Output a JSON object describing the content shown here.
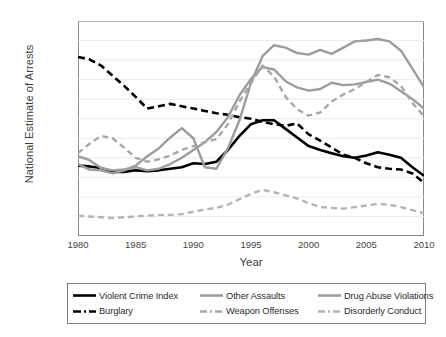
{
  "chart_data": {
    "type": "line",
    "title": "",
    "xlabel": "Year",
    "ylabel": "National Estimate of Arrests",
    "xlim": [
      1980,
      2010
    ],
    "ylim": [
      0,
      275000
    ],
    "ytick_step": 25000,
    "xtick_step": 1,
    "xtick_label_step": 5,
    "grid": "horizontal",
    "legend_position": "below",
    "ytick_labels": [
      "275,000",
      "250,000",
      "225,000",
      "200,000",
      "175,000",
      "150,000",
      "125,000",
      "100,000",
      "75,000",
      "50,000",
      "25,000",
      "0"
    ],
    "ytick_values": [
      275000,
      250000,
      225000,
      200000,
      175000,
      150000,
      125000,
      100000,
      75000,
      50000,
      25000,
      0
    ],
    "xtick_labels": [
      "1980",
      "1985",
      "1990",
      "1995",
      "2000",
      "2005",
      "2010"
    ],
    "xtick_values": [
      1980,
      1985,
      1990,
      1995,
      2000,
      2005,
      2010
    ],
    "x": [
      1980,
      1981,
      1982,
      1983,
      1984,
      1985,
      1986,
      1987,
      1988,
      1989,
      1990,
      1991,
      1992,
      1993,
      1994,
      1995,
      1996,
      1997,
      1998,
      1999,
      2000,
      2001,
      2002,
      2003,
      2004,
      2005,
      2006,
      2007,
      2008,
      2009,
      2010
    ],
    "series": [
      {
        "name": "Violent Crime Index",
        "color": "#000000",
        "style": "solid",
        "width": 2.6,
        "values": [
          90000,
          89000,
          87000,
          82000,
          82000,
          84000,
          83000,
          84000,
          86000,
          88000,
          93000,
          92000,
          95000,
          110000,
          128000,
          143000,
          148000,
          148000,
          137000,
          126000,
          115000,
          110000,
          106000,
          102000,
          100000,
          103000,
          107000,
          104000,
          100000,
          88000,
          77000
        ]
      },
      {
        "name": "Burglary",
        "color": "#000000",
        "style": "dashed",
        "width": 2.6,
        "values": [
          229000,
          226000,
          218000,
          205000,
          192000,
          178000,
          163000,
          166000,
          169000,
          166000,
          163000,
          160000,
          157000,
          155000,
          152000,
          150000,
          146000,
          143000,
          141000,
          144000,
          130000,
          122000,
          113000,
          104000,
          100000,
          93000,
          88000,
          86000,
          85000,
          80000,
          68000
        ]
      },
      {
        "name": "Other Assaults",
        "color": "#9d9d9d",
        "style": "solid",
        "width": 2.4,
        "values": [
          102000,
          97000,
          87000,
          84000,
          85000,
          88000,
          84000,
          86000,
          92000,
          100000,
          110000,
          120000,
          133000,
          152000,
          180000,
          201000,
          216000,
          213000,
          198000,
          190000,
          186000,
          188000,
          196000,
          193000,
          194000,
          197000,
          200000,
          195000,
          185000,
          175000,
          163000
        ]
      },
      {
        "name": "Weapon Offenses",
        "color": "#a8a8a8",
        "style": "dashed",
        "width": 2.4,
        "values": [
          106000,
          118000,
          128000,
          125000,
          113000,
          100000,
          95000,
          98000,
          103000,
          110000,
          115000,
          120000,
          124000,
          143000,
          172000,
          196000,
          218000,
          204000,
          178000,
          162000,
          154000,
          158000,
          172000,
          181000,
          188000,
          197000,
          206000,
          203000,
          192000,
          170000,
          153000
        ]
      },
      {
        "name": "Drug Abuse Violations",
        "color": "#9d9d9d",
        "style": "solid",
        "width": 2.4,
        "values": [
          92000,
          85000,
          84000,
          80000,
          84000,
          90000,
          102000,
          112000,
          126000,
          138000,
          125000,
          88000,
          86000,
          112000,
          148000,
          196000,
          230000,
          244000,
          241000,
          234000,
          232000,
          238000,
          233000,
          241000,
          249000,
          250000,
          252000,
          249000,
          237000,
          214000,
          190000
        ]
      },
      {
        "name": "Disorderly Conduct",
        "color": "#b4b4b4",
        "style": "dashed",
        "width": 2.4,
        "values": [
          26000,
          25000,
          24000,
          23000,
          24000,
          25000,
          26000,
          27000,
          27000,
          28000,
          31000,
          34000,
          36000,
          40000,
          47000,
          54000,
          59000,
          56000,
          52000,
          48000,
          42000,
          37000,
          36000,
          35000,
          37000,
          39000,
          41000,
          40000,
          37000,
          33000,
          29000
        ]
      }
    ]
  },
  "legend": {
    "items": [
      {
        "label": "Violent Crime Index"
      },
      {
        "label": "Other Assaults"
      },
      {
        "label": "Drug Abuse Violations"
      },
      {
        "label": "Burglary"
      },
      {
        "label": "Weapon Offenses"
      },
      {
        "label": "Disorderly Conduct"
      }
    ]
  }
}
